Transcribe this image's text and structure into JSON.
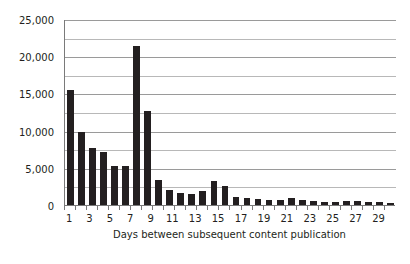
{
  "chart_data": {
    "type": "bar",
    "title": "",
    "xlabel": "Days between subsequent content publication",
    "ylabel": "Frequency",
    "categories": [
      1,
      2,
      3,
      4,
      5,
      6,
      7,
      8,
      9,
      10,
      11,
      12,
      13,
      14,
      15,
      16,
      17,
      18,
      19,
      20,
      21,
      22,
      23,
      24,
      25,
      26,
      27,
      28,
      29,
      30
    ],
    "values": [
      15400,
      9800,
      7700,
      7100,
      5200,
      5200,
      21400,
      12600,
      3300,
      2000,
      1650,
      1500,
      1900,
      3200,
      2500,
      1100,
      900,
      750,
      700,
      700,
      900,
      650,
      550,
      450,
      400,
      550,
      600,
      450,
      350,
      300
    ],
    "ylim": [
      0,
      25000
    ],
    "ytick_values": [
      0,
      5000,
      10000,
      15000,
      20000,
      25000
    ],
    "ytick_labels": [
      "0",
      "5,000",
      "10,000",
      "15,000",
      "20,000",
      "25,000"
    ],
    "yminor_values": [
      2500,
      7500,
      12500,
      17500,
      22500
    ],
    "xtick_labels": [
      "1",
      "",
      "3",
      "",
      "5",
      "",
      "7",
      "",
      "9",
      "",
      "11",
      "",
      "13",
      "",
      "15",
      "",
      "17",
      "",
      "19",
      "",
      "21",
      "",
      "23",
      "",
      "25",
      "",
      "27",
      "",
      "29",
      ""
    ],
    "grid": true,
    "legend": false,
    "bar_color": "#231f20",
    "grid_color": "#9a9a9a",
    "axis_color": "#7a7a7a",
    "text_color": "#231f20"
  }
}
